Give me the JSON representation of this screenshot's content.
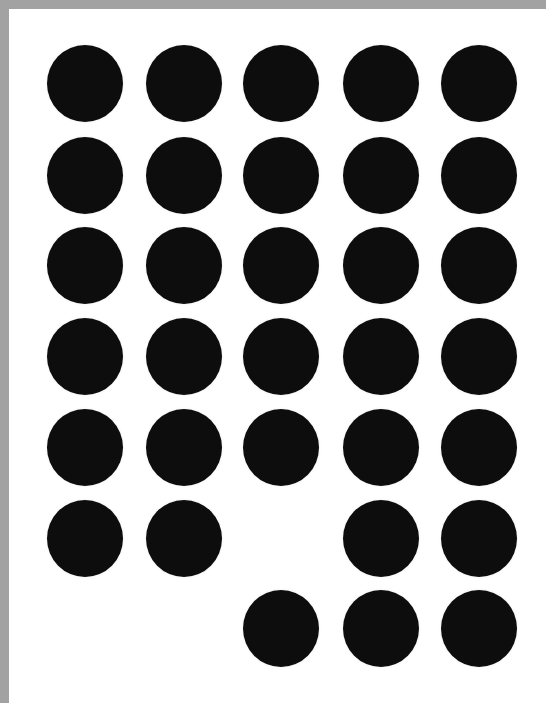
{
  "page": {
    "border_color": "#a2a2a2",
    "background_color": "#ffffff",
    "dot_color": "#0d0d0d"
  },
  "grid": {
    "columns": 5,
    "rows": 7,
    "col_x": [
      47,
      146,
      243,
      343,
      441
    ],
    "row_y": [
      45,
      137,
      227,
      318,
      409,
      500,
      590
    ],
    "dot_diameter": 76,
    "pattern": [
      [
        1,
        1,
        1,
        1,
        1
      ],
      [
        1,
        1,
        1,
        1,
        1
      ],
      [
        1,
        1,
        1,
        1,
        1
      ],
      [
        1,
        1,
        1,
        1,
        1
      ],
      [
        1,
        1,
        1,
        1,
        1
      ],
      [
        1,
        1,
        0,
        1,
        1
      ],
      [
        0,
        0,
        1,
        1,
        1
      ]
    ],
    "total_dots": 31
  }
}
